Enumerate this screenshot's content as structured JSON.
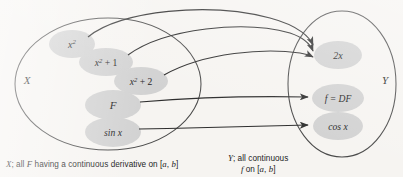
{
  "figure": {
    "background_color": "#f6f4f1",
    "node_fill": "#d2d2d2",
    "stroke_color": "#3a3a3a",
    "text_color": "#1e1e1e"
  },
  "sets": [
    {
      "id": "X",
      "label": "X",
      "label_x": 27,
      "label_y": 84,
      "caption_line1": "X; all F having a continuous derivative on [a, b]",
      "caption_parts": {
        "lead_italic": "X",
        "text_a": "; all ",
        "mid_italic": "F",
        "text_b": " having a continuous derivative on [",
        "var_a": "a",
        "text_c": ", ",
        "var_b": "b",
        "text_d": "]"
      }
    },
    {
      "id": "Y",
      "label": "Y",
      "label_x": 385,
      "label_y": 84,
      "caption_line1": "Y; all continuous",
      "caption_line2": "f on [a, b]",
      "caption_parts": {
        "lead_italic": "Y",
        "text_a": "; all continuous",
        "fn_italic": "f",
        "text_b": " on [",
        "var_a": "a",
        "text_c": ", ",
        "var_b": "b",
        "text_d": "]"
      }
    }
  ],
  "domain_nodes": [
    {
      "id": "x2",
      "label": "x²",
      "cx": 72,
      "cy": 44,
      "rx": 23,
      "ry": 14
    },
    {
      "id": "x2p1",
      "label": "x² + 1",
      "cx": 106,
      "cy": 62,
      "rx": 27,
      "ry": 14
    },
    {
      "id": "x2p2",
      "label": "x² + 2",
      "cx": 141,
      "cy": 81,
      "rx": 27,
      "ry": 14
    },
    {
      "id": "F",
      "label": "F",
      "cx": 113,
      "cy": 105,
      "rx": 28,
      "ry": 15
    },
    {
      "id": "sinx",
      "label": "sin x",
      "cx": 113,
      "cy": 132,
      "rx": 28,
      "ry": 15
    }
  ],
  "codomain_nodes": [
    {
      "id": "2x",
      "label": "2x",
      "cx": 338,
      "cy": 55,
      "rx": 24,
      "ry": 14
    },
    {
      "id": "fDF",
      "label": "f = DF",
      "cx": 338,
      "cy": 98,
      "rx": 26,
      "ry": 14
    },
    {
      "id": "cosx",
      "label": "cos x",
      "cx": 338,
      "cy": 126,
      "rx": 25,
      "ry": 14
    }
  ],
  "arrows": [
    {
      "id": "x2-to-2x",
      "from": "x2",
      "to": "2x",
      "note": "curves up over the X ellipse"
    },
    {
      "id": "x2p1-to-2x",
      "from": "x2p1",
      "to": "2x",
      "note": "curves up over the X ellipse"
    },
    {
      "id": "x2p2-to-2x",
      "from": "x2p2",
      "to": "2x",
      "note": "gentle upward curve"
    },
    {
      "id": "F-to-fDF",
      "from": "F",
      "to": "fDF",
      "note": "nearly straight"
    },
    {
      "id": "sinx-to-cosx",
      "from": "sinx",
      "to": "cosx",
      "note": "gentle upward curve"
    }
  ]
}
